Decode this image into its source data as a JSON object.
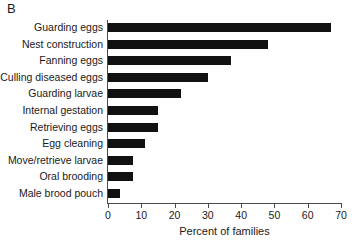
{
  "panel": {
    "letter": "B"
  },
  "chart_data": {
    "type": "bar",
    "orientation": "horizontal",
    "title": "",
    "xlabel": "Percent of families",
    "ylabel": "",
    "xlim": [
      0,
      70
    ],
    "xticks": [
      0,
      10,
      20,
      30,
      40,
      50,
      60,
      70
    ],
    "xtick_labels": [
      "0",
      "10",
      "20",
      "30",
      "40",
      "50",
      "60",
      "70"
    ],
    "grid": false,
    "legend": null,
    "bar_color": "#111111",
    "axis_color": "#4a4a4a",
    "categories": [
      "Guarding eggs",
      "Nest construction",
      "Fanning eggs",
      "Culling diseased eggs",
      "Guarding larvae",
      "Internal gestation",
      "Retrieving eggs",
      "Egg cleaning",
      "Move/retrieve larvae",
      "Oral brooding",
      "Male brood pouch"
    ],
    "values": [
      67,
      48,
      37,
      30,
      22,
      15,
      15,
      11,
      7.5,
      7.5,
      3.5
    ]
  }
}
